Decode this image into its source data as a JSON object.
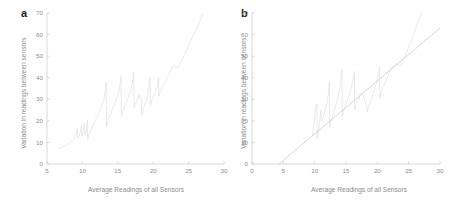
{
  "figure": {
    "panels": [
      {
        "letter": "a",
        "name": "panel-a"
      },
      {
        "letter": "b",
        "name": "panel-b"
      }
    ]
  },
  "chart_data": [
    {
      "type": "line",
      "panel": "a",
      "title": "",
      "xlabel": "Average Readings of all Sensors",
      "ylabel": "Variation in readings between sensors",
      "xlim": [
        5,
        30
      ],
      "ylim": [
        0,
        70
      ],
      "xticks": [
        5,
        10,
        15,
        20,
        25,
        30
      ],
      "xtick_labels": [
        "5",
        "10",
        "15",
        "20",
        "25",
        "30"
      ],
      "yticks": [
        0,
        10,
        20,
        30,
        40,
        50,
        60,
        70
      ],
      "ytick_labels": [
        "0",
        "10",
        "20",
        "30",
        "40",
        "50",
        "60",
        "70"
      ],
      "grid": false,
      "legend": "none",
      "series": [
        {
          "name": "variation",
          "color": "#e2e2e2",
          "x": [
            6.6,
            6.9,
            7.2,
            7.5,
            7.8,
            8.0,
            8.3,
            8.6,
            8.8,
            9.0,
            9.15,
            9.3,
            9.35,
            9.5,
            9.7,
            9.85,
            9.9,
            10.0,
            10.15,
            10.3,
            10.35,
            10.5,
            10.6,
            10.7,
            10.75,
            10.9,
            11.1,
            11.3,
            11.5,
            11.8,
            12.1,
            12.4,
            12.7,
            13.0,
            13.2,
            13.35,
            13.4,
            13.6,
            13.9,
            14.2,
            14.5,
            14.8,
            15.1,
            15.3,
            15.45,
            15.5,
            15.7,
            16.0,
            16.3,
            16.6,
            16.9,
            17.1,
            17.25,
            17.3,
            17.5,
            17.8,
            18.0,
            18.2,
            18.35,
            18.4,
            18.6,
            18.9,
            19.2,
            19.4,
            19.55,
            19.6,
            19.8,
            20.1,
            20.4,
            20.6,
            20.75,
            20.8,
            21.0,
            21.3,
            21.6,
            21.9,
            22.2,
            22.5,
            22.8,
            23.1,
            23.4,
            23.7,
            24.0,
            24.3,
            24.6,
            24.9,
            25.2,
            25.5,
            25.8,
            26.1,
            26.4,
            26.7,
            27.0
          ],
          "y": [
            7.2,
            7.4,
            7.8,
            8.3,
            8.8,
            9.4,
            10.0,
            10.8,
            11.5,
            12.6,
            14.0,
            16.5,
            12.0,
            13.0,
            14.5,
            17.5,
            13.0,
            14.0,
            15.5,
            19.0,
            13.5,
            15.0,
            16.5,
            20.5,
            11.5,
            13.5,
            15.0,
            16.5,
            18.0,
            20.0,
            22.0,
            24.0,
            26.5,
            29.5,
            33.0,
            38.0,
            17.0,
            19.5,
            22.5,
            25.0,
            27.5,
            30.0,
            33.0,
            36.5,
            41.0,
            22.0,
            24.5,
            27.0,
            29.5,
            32.0,
            35.0,
            38.5,
            42.5,
            26.0,
            28.0,
            30.0,
            32.0,
            30.5,
            29.0,
            22.5,
            25.5,
            28.5,
            31.5,
            35.0,
            40.0,
            27.0,
            29.5,
            31.5,
            34.0,
            36.5,
            40.0,
            31.5,
            33.5,
            35.5,
            37.5,
            39.5,
            41.5,
            43.5,
            45.5,
            45.0,
            44.5,
            46.0,
            48.0,
            50.0,
            52.0,
            54.0,
            56.5,
            58.5,
            60.5,
            62.5,
            64.5,
            67.0,
            69.5
          ]
        }
      ]
    },
    {
      "type": "line",
      "panel": "b",
      "title": "",
      "xlabel": "Average Readings of all Sensors",
      "ylabel": "Variation in readings between sensors",
      "xlim": [
        0,
        30
      ],
      "ylim": [
        0,
        70
      ],
      "xticks": [
        0,
        5,
        10,
        15,
        20,
        25,
        30
      ],
      "xtick_labels": [
        "0",
        "5",
        "10",
        "15",
        "20",
        "25",
        "30"
      ],
      "yticks": [
        0,
        10,
        20,
        30,
        40,
        50,
        60,
        70
      ],
      "ytick_labels": [
        "0",
        "10",
        "20",
        "30",
        "40",
        "50",
        "60",
        "70"
      ],
      "grid": false,
      "legend": "none",
      "series": [
        {
          "name": "variation",
          "color": "#e2e2e2",
          "x": [
            9.6,
            9.7,
            9.8,
            9.9,
            10.0,
            10.1,
            10.2,
            10.35,
            10.4,
            10.5,
            10.65,
            10.8,
            10.9,
            11.0,
            11.2,
            11.4,
            11.6,
            11.8,
            12.0,
            12.2,
            12.35,
            12.4,
            12.6,
            12.9,
            13.2,
            13.5,
            13.8,
            14.0,
            14.2,
            14.35,
            14.4,
            14.6,
            14.9,
            15.2,
            15.5,
            15.8,
            16.0,
            16.2,
            16.35,
            16.4,
            16.6,
            16.9,
            17.2,
            17.5,
            17.8,
            18.0,
            18.2,
            18.3,
            18.4,
            18.6,
            18.9,
            19.2,
            19.5,
            19.8,
            20.0,
            20.2,
            20.35,
            20.4,
            20.6,
            20.9,
            21.2,
            21.5,
            21.8,
            22.1,
            22.4,
            22.7,
            23.0,
            23.3,
            23.6,
            23.9,
            24.2,
            24.6,
            25.0,
            25.4,
            25.8,
            26.2,
            26.6,
            27.0
          ],
          "y": [
            13.0,
            14.5,
            16.5,
            19.0,
            22.0,
            24.5,
            26.0,
            28.0,
            11.5,
            13.5,
            16.0,
            19.0,
            22.0,
            25.0,
            20.0,
            22.0,
            24.0,
            26.5,
            29.0,
            33.0,
            38.5,
            17.0,
            19.5,
            22.5,
            25.5,
            28.5,
            32.0,
            35.0,
            39.0,
            43.5,
            22.0,
            24.5,
            27.0,
            29.5,
            32.0,
            35.0,
            37.5,
            40.0,
            43.0,
            25.5,
            27.5,
            29.5,
            31.5,
            33.0,
            31.0,
            29.0,
            27.5,
            26.0,
            24.0,
            26.5,
            29.0,
            31.5,
            34.0,
            37.0,
            39.5,
            42.0,
            45.0,
            30.5,
            33.0,
            35.5,
            37.5,
            39.5,
            41.5,
            43.5,
            45.0,
            46.0,
            46.5,
            46.0,
            45.5,
            46.5,
            48.5,
            51.0,
            54.0,
            57.0,
            60.0,
            63.5,
            67.0,
            70.0
          ]
        },
        {
          "name": "fit-line",
          "color": "#cfcfcf",
          "x": [
            4.3,
            30.0
          ],
          "y": [
            0.0,
            63.0
          ]
        }
      ]
    }
  ]
}
